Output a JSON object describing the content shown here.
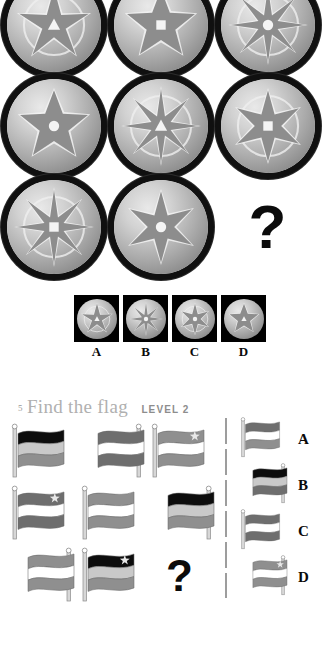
{
  "page": {
    "background": "#ffffff",
    "width": 336,
    "height": 655
  },
  "puzzle_medallion": {
    "name": "compass-medallion-matrix",
    "question_mark": "?",
    "grid": [
      [
        {
          "id": "m11",
          "symbol": "5-point-star-rose",
          "points": 5,
          "center": "triangle",
          "ring": true
        },
        {
          "id": "m12",
          "symbol": "5-point-star",
          "points": 5,
          "center": "square",
          "ring": false
        },
        {
          "id": "m13",
          "symbol": "8-point-compass-rose",
          "points": 8,
          "center": "circle",
          "ring": true
        }
      ],
      [
        {
          "id": "m21",
          "symbol": "5-point-star",
          "points": 5,
          "center": "circle",
          "ring": false
        },
        {
          "id": "m22",
          "symbol": "8-point-compass-rose",
          "points": 8,
          "center": "triangle",
          "ring": true
        },
        {
          "id": "m23",
          "symbol": "6-point-star",
          "points": 6,
          "center": "square",
          "ring": true
        }
      ],
      [
        {
          "id": "m31",
          "symbol": "8-point-compass-rose",
          "points": 8,
          "center": "square",
          "ring": true
        },
        {
          "id": "m32",
          "symbol": "6-point-star",
          "points": 6,
          "center": "circle",
          "ring": false
        },
        {
          "id": "m33",
          "symbol": "missing",
          "points": 0,
          "center": "none",
          "ring": false
        }
      ]
    ],
    "options": [
      {
        "label": "A",
        "symbol": "5-point-star-rose",
        "points": 5,
        "center": "triangle",
        "ring": true
      },
      {
        "label": "B",
        "symbol": "8-point-compass-rose",
        "points": 8,
        "center": "circle",
        "ring": false
      },
      {
        "label": "C",
        "symbol": "6-point-star",
        "points": 6,
        "center": "circle",
        "ring": true
      },
      {
        "label": "D",
        "symbol": "5-point-star",
        "points": 5,
        "center": "triangle",
        "ring": false
      }
    ]
  },
  "puzzle_flag": {
    "number": "5",
    "title": "Find the flag",
    "level": "LEVEL 2",
    "question_mark": "?",
    "colors": {
      "black": "#0d0d0d",
      "dark_gray": "#6e6e6e",
      "mid_gray": "#8f8f8f",
      "light_gray": "#c9c9c9",
      "white": "#ffffff",
      "pole": "#d7d7d7",
      "pole_edge": "#8a8a8a",
      "star": "#e8e8e8",
      "divider": "#9d9d9d",
      "title": "#b0b0b0",
      "level": "#8d8d8d"
    },
    "grid": [
      [
        {
          "id": "f11",
          "pole": "left",
          "stripes": [
            "black",
            "light_gray",
            "mid_gray"
          ],
          "star": false
        },
        {
          "id": "f12",
          "pole": "right",
          "stripes": [
            "dark_gray",
            "white",
            "dark_gray"
          ],
          "star": false
        },
        {
          "id": "f13",
          "pole": "left",
          "stripes": [
            "mid_gray",
            "white",
            "mid_gray"
          ],
          "star": true
        }
      ],
      [
        {
          "id": "f21",
          "pole": "left",
          "stripes": [
            "dark_gray",
            "white",
            "dark_gray"
          ],
          "star": true
        },
        {
          "id": "f22",
          "pole": "left",
          "stripes": [
            "mid_gray",
            "white",
            "mid_gray"
          ],
          "star": false
        },
        {
          "id": "f23",
          "pole": "right",
          "stripes": [
            "black",
            "light_gray",
            "mid_gray"
          ],
          "star": false
        }
      ],
      [
        {
          "id": "f31",
          "pole": "right",
          "stripes": [
            "mid_gray",
            "white",
            "mid_gray"
          ],
          "star": false
        },
        {
          "id": "f32",
          "pole": "left",
          "stripes": [
            "black",
            "light_gray",
            "mid_gray"
          ],
          "star": true
        },
        {
          "id": "f33",
          "pole": "none",
          "stripes": [],
          "star": false
        }
      ]
    ],
    "options": [
      {
        "label": "A",
        "pole": "left",
        "stripes": [
          "dark_gray",
          "white",
          "mid_gray"
        ],
        "star": false
      },
      {
        "label": "B",
        "pole": "right",
        "stripes": [
          "black",
          "light_gray",
          "dark_gray"
        ],
        "star": false
      },
      {
        "label": "C",
        "pole": "left",
        "stripes": [
          "dark_gray",
          "white",
          "dark_gray"
        ],
        "star": false
      },
      {
        "label": "D",
        "pole": "right",
        "stripes": [
          "mid_gray",
          "white",
          "mid_gray"
        ],
        "star": true
      }
    ]
  }
}
